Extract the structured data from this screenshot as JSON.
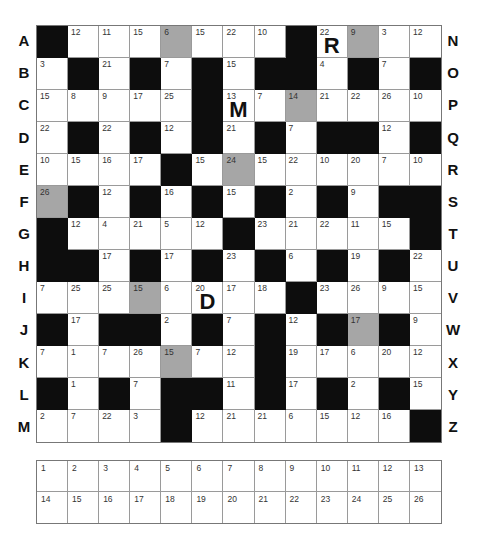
{
  "puzzle": {
    "type": "codeword",
    "left_labels": [
      "A",
      "B",
      "C",
      "D",
      "E",
      "F",
      "G",
      "H",
      "I",
      "J",
      "K",
      "L",
      "M"
    ],
    "right_labels": [
      "N",
      "O",
      "P",
      "Q",
      "R",
      "S",
      "T",
      "U",
      "V",
      "W",
      "X",
      "Y",
      "Z"
    ],
    "grid": [
      [
        0,
        12,
        11,
        15,
        "6g",
        15,
        22,
        10,
        0,
        "22:R",
        "9g",
        3,
        12
      ],
      [
        3,
        0,
        21,
        0,
        7,
        0,
        15,
        0,
        0,
        4,
        0,
        7,
        0
      ],
      [
        15,
        8,
        9,
        17,
        25,
        0,
        "13:M",
        7,
        "14g",
        21,
        22,
        26,
        10
      ],
      [
        22,
        0,
        22,
        0,
        12,
        0,
        21,
        0,
        7,
        0,
        0,
        12,
        0
      ],
      [
        10,
        15,
        16,
        17,
        0,
        15,
        "24g",
        15,
        22,
        10,
        20,
        7,
        10
      ],
      [
        "26g",
        0,
        12,
        0,
        16,
        0,
        15,
        0,
        2,
        0,
        9,
        0,
        0
      ],
      [
        0,
        12,
        4,
        21,
        5,
        12,
        0,
        23,
        21,
        22,
        11,
        15,
        0
      ],
      [
        0,
        0,
        17,
        0,
        17,
        0,
        23,
        0,
        6,
        0,
        19,
        0,
        22
      ],
      [
        7,
        25,
        25,
        "15g",
        6,
        "20:D",
        17,
        18,
        0,
        23,
        26,
        9,
        15
      ],
      [
        0,
        17,
        0,
        0,
        2,
        0,
        7,
        0,
        12,
        0,
        "17g",
        0,
        9
      ],
      [
        7,
        1,
        7,
        26,
        "15g",
        7,
        12,
        0,
        19,
        17,
        6,
        20,
        12
      ],
      [
        0,
        1,
        0,
        7,
        0,
        0,
        11,
        0,
        17,
        0,
        2,
        0,
        15
      ],
      [
        2,
        7,
        22,
        3,
        0,
        12,
        21,
        21,
        6,
        15,
        12,
        16,
        0
      ]
    ],
    "given_letters": {
      "22": "R",
      "13": "M",
      "20": "D"
    },
    "key_numbers": [
      1,
      2,
      3,
      4,
      5,
      6,
      7,
      8,
      9,
      10,
      11,
      12,
      13,
      14,
      15,
      16,
      17,
      18,
      19,
      20,
      21,
      22,
      23,
      24,
      25,
      26
    ]
  }
}
